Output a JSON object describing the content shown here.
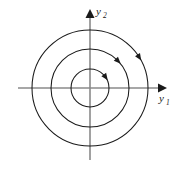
{
  "figure": {
    "background_color": "#ffffff",
    "width": 179,
    "height": 169
  },
  "axes": {
    "origin": {
      "x": 90,
      "y": 88
    },
    "horizontal": {
      "name": "y1",
      "label_main": "y",
      "label_sub": "1",
      "start_x": 18,
      "end_x": 166,
      "label_x": 160,
      "label_y": 99,
      "color": "#8a8a8a"
    },
    "vertical": {
      "name": "y2",
      "label_main": "y",
      "label_sub": "2",
      "start_y": 160,
      "end_y": 10,
      "label_x": 97,
      "label_y": 14,
      "color": "#8a8a8a"
    }
  },
  "chart_data": {
    "type": "scatter",
    "xlabel": "y1",
    "ylabel": "y2",
    "grid": false,
    "legend": "none",
    "center": {
      "x": 0,
      "y": 0
    },
    "trajectories": [
      {
        "name": "inner-orbit",
        "radius_px": 19,
        "direction": "clockwise",
        "arrow_angle_deg": 35,
        "color": "#1a1a1a"
      },
      {
        "name": "middle-orbit",
        "radius_px": 39,
        "direction": "clockwise",
        "arrow_angle_deg": 44,
        "color": "#1a1a1a"
      },
      {
        "name": "outer-orbit",
        "radius_px": 58,
        "direction": "clockwise",
        "arrow_angle_deg": 32,
        "color": "#1a1a1a"
      }
    ]
  }
}
